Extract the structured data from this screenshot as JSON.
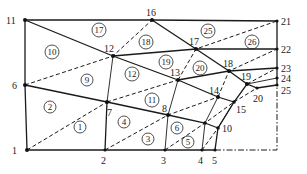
{
  "diagram": {
    "type": "finite-element-mesh",
    "nodes": [
      {
        "id": "1",
        "x": 27,
        "y": 150,
        "lx": 12,
        "ly": 154
      },
      {
        "id": "2",
        "x": 105,
        "y": 150,
        "lx": 101,
        "ly": 164
      },
      {
        "id": "3",
        "x": 165,
        "y": 150,
        "lx": 161,
        "ly": 164
      },
      {
        "id": "4",
        "x": 202,
        "y": 150,
        "lx": 198,
        "ly": 164
      },
      {
        "id": "5",
        "x": 215,
        "y": 150,
        "lx": 212,
        "ly": 164
      },
      {
        "id": "6",
        "x": 25,
        "y": 85,
        "lx": 12,
        "ly": 89
      },
      {
        "id": "7",
        "x": 107,
        "y": 102,
        "lx": 108,
        "ly": 115
      },
      {
        "id": "8",
        "x": 168,
        "y": 115,
        "lx": 163,
        "ly": 112
      },
      {
        "id": "9",
        "x": 205,
        "y": 123,
        "lx": 0,
        "ly": 0
      },
      {
        "id": "10",
        "x": 218,
        "y": 128,
        "lx": 222,
        "ly": 132
      },
      {
        "id": "11",
        "x": 25,
        "y": 20,
        "lx": 8,
        "ly": 24
      },
      {
        "id": "12",
        "x": 113,
        "y": 56,
        "lx": 106,
        "ly": 52
      },
      {
        "id": "13",
        "x": 178,
        "y": 80,
        "lx": 173,
        "ly": 76
      },
      {
        "id": "14",
        "x": 218,
        "y": 97,
        "lx": 210,
        "ly": 94
      },
      {
        "id": "15",
        "x": 234,
        "y": 102,
        "lx": 236,
        "ly": 113
      },
      {
        "id": "16",
        "x": 152,
        "y": 20,
        "lx": 146,
        "ly": 16
      },
      {
        "id": "17",
        "x": 196,
        "y": 49,
        "lx": 189,
        "ly": 45
      },
      {
        "id": "18",
        "x": 229,
        "y": 71,
        "lx": 223,
        "ly": 66
      },
      {
        "id": "19",
        "x": 247,
        "y": 84,
        "lx": 242,
        "ly": 79
      },
      {
        "id": "20",
        "x": 257,
        "y": 88,
        "lx": 254,
        "ly": 101
      },
      {
        "id": "21",
        "x": 277,
        "y": 21,
        "lx": 281,
        "ly": 25
      },
      {
        "id": "22",
        "x": 277,
        "y": 49,
        "lx": 281,
        "ly": 53
      },
      {
        "id": "23",
        "x": 277,
        "y": 68,
        "lx": 281,
        "ly": 72
      },
      {
        "id": "24",
        "x": 277,
        "y": 78,
        "lx": 281,
        "ly": 82
      },
      {
        "id": "25",
        "x": 277,
        "y": 85,
        "lx": 281,
        "ly": 95
      }
    ],
    "elements": [
      {
        "id": "1",
        "x": 80,
        "y": 127
      },
      {
        "id": "2",
        "x": 50,
        "y": 107
      },
      {
        "id": "3",
        "x": 148,
        "y": 139
      },
      {
        "id": "4",
        "x": 124,
        "y": 122
      },
      {
        "id": "5",
        "x": 188,
        "y": 142
      },
      {
        "id": "6",
        "x": 177,
        "y": 128
      },
      {
        "id": "7",
        "x": 60,
        "y": 28
      },
      {
        "id": "8",
        "x": 60,
        "y": 28
      },
      {
        "id": "9",
        "x": 87,
        "y": 80
      },
      {
        "id": "10",
        "x": 52,
        "y": 52
      },
      {
        "id": "11",
        "x": 152,
        "y": 100
      },
      {
        "id": "12",
        "x": 132,
        "y": 74
      },
      {
        "id": "17",
        "x": 99,
        "y": 30
      },
      {
        "id": "18",
        "x": 146,
        "y": 42
      },
      {
        "id": "19",
        "x": 166,
        "y": 62
      },
      {
        "id": "20",
        "x": 200,
        "y": 68
      },
      {
        "id": "25",
        "x": 208,
        "y": 31
      },
      {
        "id": "26",
        "x": 252,
        "y": 42
      }
    ]
  }
}
